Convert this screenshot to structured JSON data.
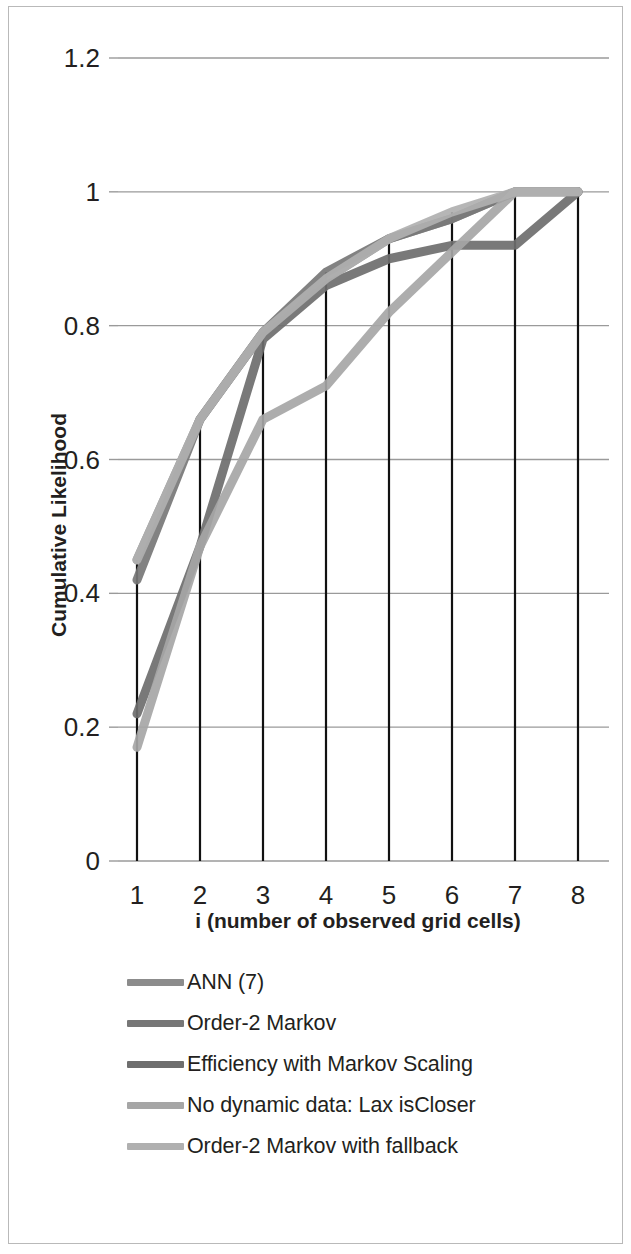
{
  "chart_data": {
    "type": "line",
    "title": "",
    "xlabel": "i (number of observed grid cells)",
    "ylabel": "Cumulative Likelihood",
    "x": [
      1,
      2,
      3,
      4,
      5,
      6,
      7,
      8
    ],
    "categories": [
      "1",
      "2",
      "3",
      "4",
      "5",
      "6",
      "7",
      "8"
    ],
    "xtick_labels": [
      "1",
      "2",
      "3",
      "4",
      "5",
      "6",
      "7",
      "8"
    ],
    "ytick_labels": [
      "0",
      "0.2",
      "0.4",
      "0.6",
      "0.8",
      "1",
      "1.2"
    ],
    "ytick_values": [
      0,
      0.2,
      0.4,
      0.6,
      0.8,
      1,
      1.2
    ],
    "ylim": [
      0,
      1.2
    ],
    "xlim": [
      1,
      8
    ],
    "grid": "horizontal",
    "legend_position": "bottom-left",
    "drop_lines": true,
    "series": [
      {
        "name": "ANN (7)",
        "color": "#8c8c8c",
        "values": [
          0.45,
          0.66,
          0.79,
          0.87,
          0.93,
          0.96,
          1.0,
          1.0
        ]
      },
      {
        "name": "Order-2 Markov",
        "color": "#777777",
        "values": [
          0.42,
          0.66,
          0.79,
          0.88,
          0.93,
          0.96,
          1.0,
          1.0
        ]
      },
      {
        "name": "Efficiency with Markov Scaling",
        "color": "#6e6e6e",
        "values": [
          0.22,
          0.47,
          0.78,
          0.86,
          0.9,
          0.92,
          0.92,
          1.0
        ]
      },
      {
        "name": "No dynamic data: Lax isCloser",
        "color": "#a6a6a6",
        "values": [
          0.17,
          0.47,
          0.66,
          0.71,
          0.82,
          0.91,
          1.0,
          1.0
        ]
      },
      {
        "name": "Order-2 Markov with fallback",
        "color": "#b0b0b0",
        "values": [
          0.45,
          0.66,
          0.79,
          0.87,
          0.93,
          0.97,
          1.0,
          1.0
        ]
      }
    ]
  },
  "axes": {
    "y_title": "Cumulative Likelihood",
    "x_title": "i (number of observed grid cells)",
    "ytick_0": "0",
    "ytick_1": "0.2",
    "ytick_2": "0.4",
    "ytick_3": "0.6",
    "ytick_4": "0.8",
    "ytick_5": "1",
    "ytick_6": "1.2",
    "xtick_1": "1",
    "xtick_2": "2",
    "xtick_3": "3",
    "xtick_4": "4",
    "xtick_5": "5",
    "xtick_6": "6",
    "xtick_7": "7",
    "xtick_8": "8"
  },
  "legend": {
    "items": [
      {
        "label": "ANN (7)",
        "color": "#8c8c8c"
      },
      {
        "label": "Order-2 Markov",
        "color": "#777777"
      },
      {
        "label": "Efficiency with Markov Scaling",
        "color": "#6e6e6e"
      },
      {
        "label": "No dynamic data: Lax isCloser",
        "color": "#a6a6a6"
      },
      {
        "label": "Order-2 Markov with fallback",
        "color": "#b0b0b0"
      }
    ]
  },
  "colors": {
    "gridline": "#9a9a9a",
    "droplines": "#111111",
    "text": "#231f20",
    "background": "#ffffff",
    "frame": "#b9b9b9"
  }
}
